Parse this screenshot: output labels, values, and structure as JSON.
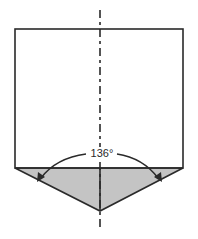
{
  "diagram": {
    "angle_label": "136°",
    "colors": {
      "line": "#2a2a2a",
      "fill_tip": "#c4c4c4",
      "background": "#ffffff"
    },
    "parts": [
      "body-rectangle",
      "conical-tip",
      "centerline",
      "angle-arc-with-arrows"
    ]
  }
}
